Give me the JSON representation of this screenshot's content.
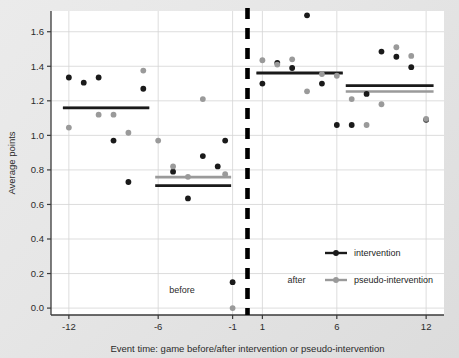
{
  "chart_data": {
    "type": "scatter",
    "title": "",
    "xlabel": "Event time: game before/after intervention or pseudo-intervention",
    "ylabel": "Average points",
    "xlim": [
      -13.2,
      13.2
    ],
    "ylim": [
      -0.04,
      1.72
    ],
    "xticks": [
      -12,
      -6,
      -1,
      1,
      6,
      12
    ],
    "xtick_labels": [
      "-12",
      "-6",
      "-1",
      "1",
      "6",
      "12"
    ],
    "yticks": [
      0.0,
      0.2,
      0.4,
      0.6,
      0.8,
      1.0,
      1.2,
      1.4,
      1.6
    ],
    "ytick_labels": [
      "0.0",
      "0.2",
      "0.4",
      "0.6",
      "0.8",
      "1.0",
      "1.2",
      "1.4",
      "1.6"
    ],
    "grid": true,
    "grid_axis": "both",
    "legend_position": "lower right",
    "legend": [
      {
        "name": "intervention",
        "color": "#1a1a1a"
      },
      {
        "name": "pseudo-intervention",
        "color": "#9a9a9a"
      }
    ],
    "series": [
      {
        "name": "intervention",
        "color": "#1a1a1a",
        "marker": "circle",
        "points": [
          {
            "x": -12,
            "y": 1.335
          },
          {
            "x": -11,
            "y": 1.305
          },
          {
            "x": -10,
            "y": 1.335
          },
          {
            "x": -9,
            "y": 0.97
          },
          {
            "x": -8,
            "y": 0.73
          },
          {
            "x": -7,
            "y": 1.27
          },
          {
            "x": -5,
            "y": 0.79
          },
          {
            "x": -4,
            "y": 0.635
          },
          {
            "x": -3,
            "y": 0.88
          },
          {
            "x": -2,
            "y": 0.82
          },
          {
            "x": -1.5,
            "y": 0.97
          },
          {
            "x": -1,
            "y": 0.15
          },
          {
            "x": 1,
            "y": 1.3
          },
          {
            "x": 2,
            "y": 1.42
          },
          {
            "x": 3,
            "y": 1.39
          },
          {
            "x": 4,
            "y": 1.695
          },
          {
            "x": 5,
            "y": 1.3
          },
          {
            "x": 6,
            "y": 1.06
          },
          {
            "x": 7,
            "y": 1.06
          },
          {
            "x": 8,
            "y": 1.24
          },
          {
            "x": 9,
            "y": 1.485
          },
          {
            "x": 10,
            "y": 1.455
          },
          {
            "x": 11,
            "y": 1.395
          },
          {
            "x": 12,
            "y": 1.09
          }
        ]
      },
      {
        "name": "pseudo-intervention",
        "color": "#9a9a9a",
        "marker": "circle",
        "points": [
          {
            "x": -12,
            "y": 1.045
          },
          {
            "x": -10,
            "y": 1.12
          },
          {
            "x": -9,
            "y": 1.12
          },
          {
            "x": -8,
            "y": 1.015
          },
          {
            "x": -7,
            "y": 1.375
          },
          {
            "x": -6,
            "y": 0.97
          },
          {
            "x": -5,
            "y": 0.82
          },
          {
            "x": -4,
            "y": 0.76
          },
          {
            "x": -3,
            "y": 1.21
          },
          {
            "x": -1.5,
            "y": 0.775
          },
          {
            "x": -1,
            "y": 0.0
          },
          {
            "x": 1,
            "y": 1.435
          },
          {
            "x": 2,
            "y": 1.41
          },
          {
            "x": 3,
            "y": 1.44
          },
          {
            "x": 4,
            "y": 1.255
          },
          {
            "x": 5,
            "y": 1.355
          },
          {
            "x": 6,
            "y": 1.345
          },
          {
            "x": 7,
            "y": 1.21
          },
          {
            "x": 8,
            "y": 1.06
          },
          {
            "x": 9,
            "y": 1.18
          },
          {
            "x": 10,
            "y": 1.51
          },
          {
            "x": 11,
            "y": 1.46
          },
          {
            "x": 12,
            "y": 1.095
          }
        ]
      }
    ],
    "mean_segments": [
      {
        "series": "intervention",
        "x_start": -12.4,
        "x_end": -6.6,
        "y": 1.158
      },
      {
        "series": "pseudo-intervention",
        "x_start": -12.4,
        "x_end": -6.6,
        "y": 1.162
      },
      {
        "series": "intervention",
        "x_start": -6.2,
        "x_end": -1.1,
        "y": 0.709
      },
      {
        "series": "pseudo-intervention",
        "x_start": -6.2,
        "x_end": -1.1,
        "y": 0.758
      },
      {
        "series": "intervention",
        "x_start": 0.6,
        "x_end": 6.4,
        "y": 1.362
      },
      {
        "series": "pseudo-intervention",
        "x_start": 0.6,
        "x_end": 6.4,
        "y": 1.358
      },
      {
        "series": "intervention",
        "x_start": 6.6,
        "x_end": 12.5,
        "y": 1.288
      },
      {
        "series": "pseudo-intervention",
        "x_start": 6.6,
        "x_end": 12.5,
        "y": 1.254
      }
    ],
    "vertical_divider": {
      "x": 0,
      "style": "dashed",
      "color": "#000000"
    },
    "annotations": [
      {
        "text": "before",
        "x": -4.4,
        "y": 0.085
      },
      {
        "text": "after",
        "x": 3.3,
        "y": 0.145
      }
    ]
  }
}
